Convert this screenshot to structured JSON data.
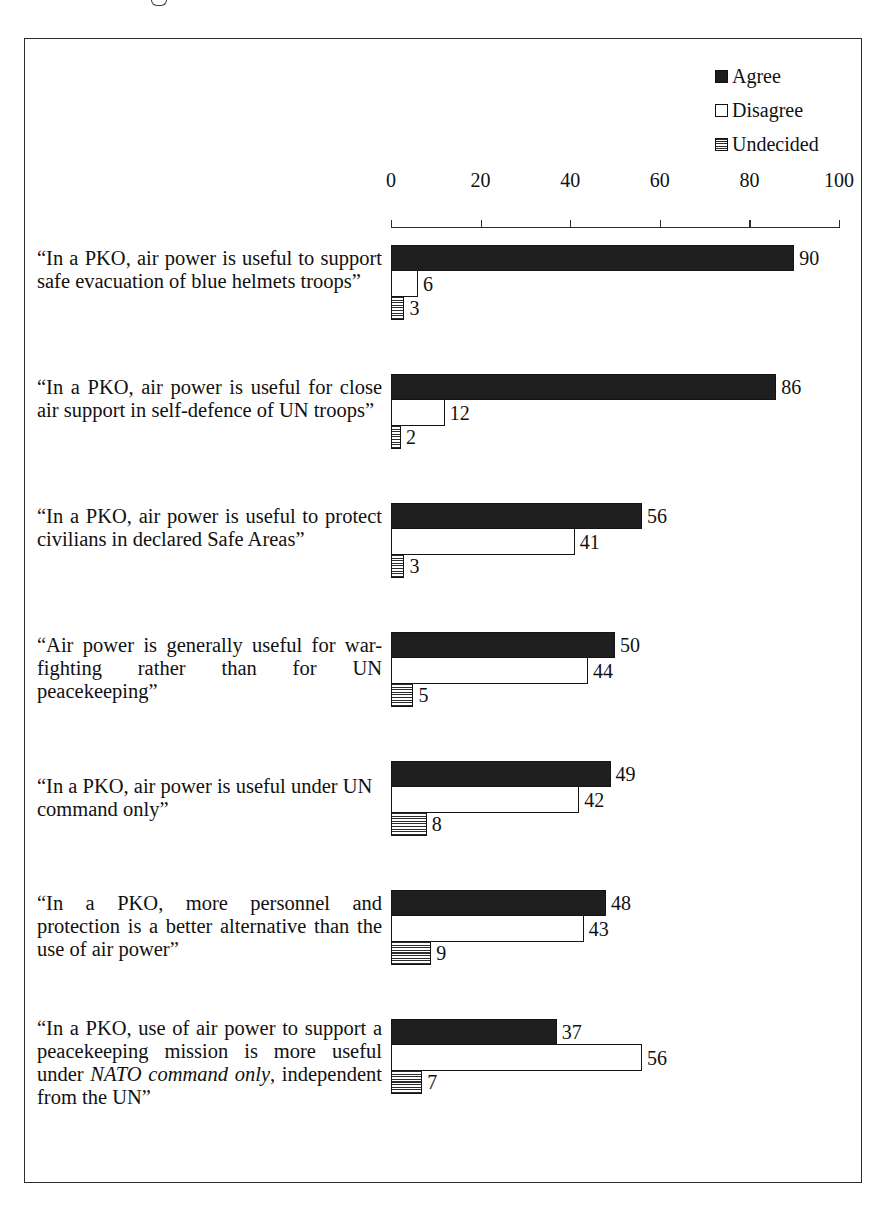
{
  "legend": {
    "items": [
      {
        "label": "Agree",
        "swatch": "filled-black-swatch-icon",
        "color": "#1c1c1c"
      },
      {
        "label": "Disagree",
        "swatch": "empty-white-swatch-icon",
        "color": "#ffffff"
      },
      {
        "label": "Undecided",
        "swatch": "striped-swatch-icon",
        "color": "#2a2a2a"
      }
    ]
  },
  "chart_data": {
    "type": "bar",
    "orientation": "horizontal",
    "title": "",
    "subtitle": "",
    "xlabel": "",
    "ylabel": "",
    "xlim": [
      0,
      100
    ],
    "xticks": [
      0,
      20,
      40,
      60,
      80,
      100
    ],
    "grid": false,
    "legend_position": "top-right",
    "legend_entries": [
      "Agree",
      "Disagree",
      "Undecided"
    ],
    "categories": [
      "“In a PKO, air power is useful to support safe evacuation of blue helmets troops”",
      "“In a PKO, air power is useful for close air support in self-defence of UN troops”",
      "“In a PKO, air power is useful to protect civilians in declared Safe Areas”",
      "“Air power  is generally useful for war-fighting rather than for UN peacekeeping”",
      "“In a PKO, air power is useful under UN command only”",
      "“In a PKO, more personnel and protection is a better alternative than the use of air power”",
      "“In a PKO, use of air power to support a peacekeeping mission is more useful under NATO command only, independent from the UN”"
    ],
    "series": [
      {
        "name": "Agree",
        "values": [
          90,
          86,
          56,
          50,
          49,
          48,
          37
        ]
      },
      {
        "name": "Disagree",
        "values": [
          6,
          12,
          41,
          44,
          42,
          43,
          56
        ]
      },
      {
        "name": "Undecided",
        "values": [
          3,
          2,
          3,
          5,
          8,
          9,
          7
        ]
      }
    ]
  },
  "groups": [
    {
      "label_html": "“In a PKO, air power is useful to support safe evacuation of blue helmets troops”",
      "lines": 3,
      "justify": true,
      "bars": [
        {
          "series": "Agree",
          "value": 90
        },
        {
          "series": "Disagree",
          "value": 6
        },
        {
          "series": "Undecided",
          "value": 3
        }
      ]
    },
    {
      "label_html": "“In a PKO, air power is useful for close air support in self-defence of UN troops”",
      "lines": 3,
      "justify": true,
      "bars": [
        {
          "series": "Agree",
          "value": 86
        },
        {
          "series": "Disagree",
          "value": 12
        },
        {
          "series": "Undecided",
          "value": 2
        }
      ]
    },
    {
      "label_html": "“In a PKO, air power is useful to protect civilians in declared Safe Areas”",
      "lines": 3,
      "justify": true,
      "bars": [
        {
          "series": "Agree",
          "value": 56
        },
        {
          "series": "Disagree",
          "value": 41
        },
        {
          "series": "Undecided",
          "value": 3
        }
      ]
    },
    {
      "label_html": "“Air power  is generally useful for war-fighting rather than for UN peacekeeping”",
      "lines": 3,
      "justify": true,
      "bars": [
        {
          "series": "Agree",
          "value": 50
        },
        {
          "series": "Disagree",
          "value": 44
        },
        {
          "series": "Undecided",
          "value": 5
        }
      ]
    },
    {
      "label_html": "“In a PKO, air power is useful under UN command only”",
      "lines": 2,
      "justify": false,
      "bars": [
        {
          "series": "Agree",
          "value": 49
        },
        {
          "series": "Disagree",
          "value": 42
        },
        {
          "series": "Undecided",
          "value": 8
        }
      ]
    },
    {
      "label_html": "“In a PKO, more personnel and protection is a better alternative than the use of air power”",
      "lines": 3,
      "justify": true,
      "bars": [
        {
          "series": "Agree",
          "value": 48
        },
        {
          "series": "Disagree",
          "value": 43
        },
        {
          "series": "Undecided",
          "value": 9
        }
      ]
    },
    {
      "label_html": "“In a PKO, use of air power to support a peacekeeping mission is more useful under <em>NATO command only</em>, independent from the UN”",
      "lines": 4,
      "justify": true,
      "bars": [
        {
          "series": "Agree",
          "value": 37
        },
        {
          "series": "Disagree",
          "value": 56
        },
        {
          "series": "Undecided",
          "value": 7
        }
      ]
    }
  ]
}
